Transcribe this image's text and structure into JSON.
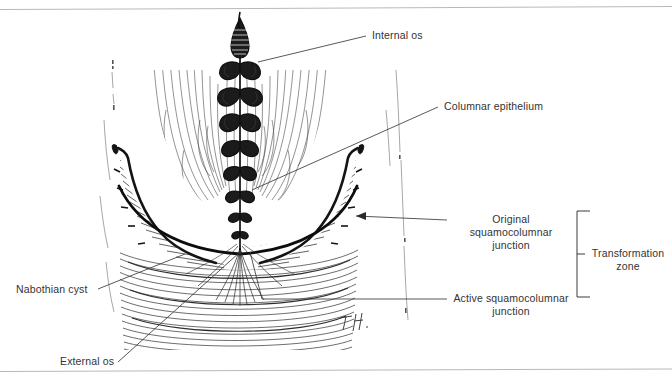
{
  "figure": {
    "type": "anatomical-line-drawing",
    "medium": "pen-and-ink illustration",
    "signature": "T.H.",
    "ink_color": "#1a1a1a",
    "background_color": "#ffffff",
    "rule_color": "#b9b9b9"
  },
  "labels": {
    "internal_os": "Internal os",
    "columnar_epithelium": "Columnar epithelium",
    "original_scj_line1": "Original squamocolumnar",
    "original_scj_line2": "junction",
    "active_scj_line1": "Active squamocolumnar",
    "active_scj_line2": "junction",
    "transformation_zone_line1": "Transformation",
    "transformation_zone_line2": "zone",
    "nabothian_cyst": "Nabothian cyst",
    "external_os": "External os"
  },
  "structures": [
    {
      "name": "internal-os",
      "description": "dark spindle-shaped upper canal opening"
    },
    {
      "name": "endocervical-canal",
      "description": "vertical canal with plicae palmatae lobes"
    },
    {
      "name": "columnar-epithelium",
      "description": "lobed folds lining the endocervical canal"
    },
    {
      "name": "cervical-stroma",
      "description": "wavy concentric contour shading"
    },
    {
      "name": "original-squamocolumnar-junction",
      "description": "outer boundary curve of the transformation zone"
    },
    {
      "name": "active-squamocolumnar-junction",
      "description": "inner boundary at the external os"
    },
    {
      "name": "nabothian-cysts",
      "description": "small open circles along the junction band"
    },
    {
      "name": "external-os",
      "description": "fan of radiating lines at the canal opening"
    },
    {
      "name": "ectocervix",
      "description": "lower portion with horizontal sweeping strokes"
    },
    {
      "name": "transformation-zone-bracket",
      "description": "square bracket spanning both junctions"
    }
  ]
}
